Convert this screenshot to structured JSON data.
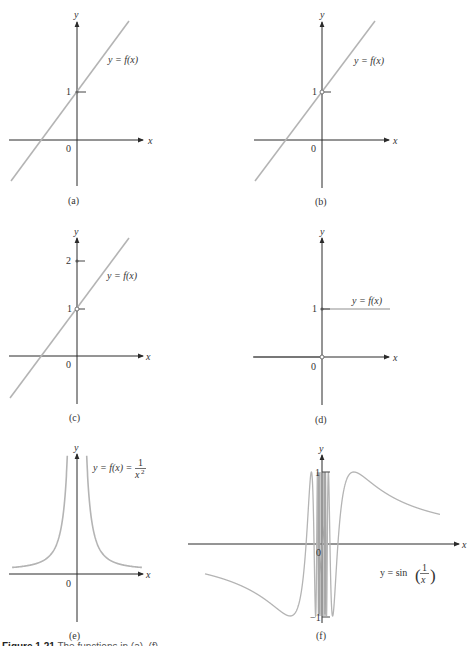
{
  "figure": {
    "caption_label": "Figure 1.21",
    "caption_partial": "The functions in (a)–(f) ..."
  },
  "chart_data": [
    {
      "panel": "(a)",
      "type": "line",
      "function_label": "y = f(x)",
      "xlabel": "x",
      "ylabel": "y",
      "origin_label": "0",
      "y_ticks": [
        1
      ],
      "description": "Straight line with slope ~1.3 passing through (0,1); closed point at (0,1)",
      "points": [
        [
          -1.75,
          -1.25
        ],
        [
          1.4,
          2.65
        ]
      ]
    },
    {
      "panel": "(b)",
      "type": "line",
      "function_label": "y = f(x)",
      "xlabel": "x",
      "ylabel": "y",
      "origin_label": "0",
      "y_ticks": [
        1
      ],
      "description": "Same line through (0,1) but with a hole (open circle) at (0,1)",
      "hole": [
        0,
        1
      ],
      "points": [
        [
          -1.75,
          -1.25
        ],
        [
          1.4,
          2.65
        ]
      ]
    },
    {
      "panel": "(c)",
      "type": "line",
      "function_label": "y = f(x)",
      "xlabel": "x",
      "ylabel": "y",
      "origin_label": "0",
      "y_ticks": [
        1,
        2
      ],
      "description": "Line through (0,1) with hole at (0,1) and isolated point f(0)=2",
      "hole": [
        0,
        1
      ],
      "isolated_point": [
        0,
        2
      ],
      "points": [
        [
          -1.75,
          -1.25
        ],
        [
          1.4,
          2.65
        ]
      ]
    },
    {
      "panel": "(d)",
      "type": "line",
      "function_label": "y = f(x)",
      "xlabel": "x",
      "ylabel": "y",
      "origin_label": "0",
      "y_ticks": [
        1
      ],
      "description": "Unit step: y=0 for x<0 (open at 0), y=1 for x>=0 (closed at 0)",
      "segments": [
        {
          "x": [
            -1.45,
            0
          ],
          "y": 0
        },
        {
          "x": [
            0,
            1.45
          ],
          "y": 1
        }
      ]
    },
    {
      "panel": "(e)",
      "type": "line",
      "function_label": "y = f(x) = 1/x²",
      "function_label_parts": {
        "lhs": "y = f(x) =",
        "num": "1",
        "den": "x",
        "exp": "2"
      },
      "xlabel": "x",
      "ylabel": "y",
      "origin_label": "0",
      "description": "y = 1/x^2, vertical asymptote at x=0, approaches 0 as |x| grows",
      "x_range": [
        -3,
        3
      ]
    },
    {
      "panel": "(f)",
      "type": "line",
      "function_label": "y = sin(1/x)",
      "function_label_parts": {
        "lhs": "y = sin",
        "num": "1",
        "den": "x"
      },
      "xlabel": "x",
      "ylabel": "y",
      "origin_label": "0",
      "y_ticks": [
        1,
        -1
      ],
      "description": "y = sin(1/x), oscillating infinitely near 0 between -1 and 1",
      "ylim": [
        -1,
        1
      ]
    }
  ]
}
